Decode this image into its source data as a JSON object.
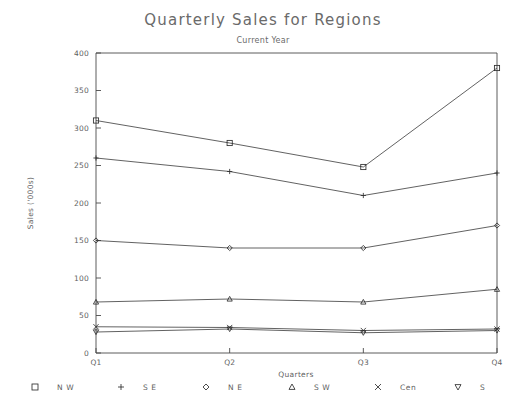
{
  "chart_data": {
    "type": "line",
    "title": "Quarterly Sales for Regions",
    "subtitle": "Current Year",
    "xlabel": "Quarters",
    "ylabel": "Sales ('000s)",
    "categories": [
      "Q1",
      "Q2",
      "Q3",
      "Q4"
    ],
    "ylim": [
      0,
      400
    ],
    "yticks": [
      "0",
      "50",
      "100",
      "150",
      "200",
      "250",
      "300",
      "350",
      "400"
    ],
    "ytick_values": [
      0,
      50,
      100,
      150,
      200,
      250,
      300,
      350,
      400
    ],
    "grid": false,
    "legend_position": "bottom",
    "series": [
      {
        "name": "N W",
        "marker": "square",
        "values": [
          310,
          280,
          248,
          380
        ]
      },
      {
        "name": "S E",
        "marker": "plus",
        "values": [
          260,
          242,
          210,
          240
        ]
      },
      {
        "name": "N E",
        "marker": "diamond",
        "values": [
          150,
          140,
          140,
          170
        ]
      },
      {
        "name": "S W",
        "marker": "triangle-up",
        "values": [
          68,
          72,
          68,
          85
        ]
      },
      {
        "name": "Cen",
        "marker": "cross",
        "values": [
          35,
          34,
          30,
          32
        ]
      },
      {
        "name": "S",
        "marker": "triangle-down",
        "values": [
          28,
          32,
          27,
          30
        ]
      }
    ]
  },
  "legend": {
    "items": [
      {
        "symbol": "□",
        "label": "N W"
      },
      {
        "symbol": "+",
        "label": "S E"
      },
      {
        "symbol": "◇",
        "label": "N E"
      },
      {
        "symbol": "△",
        "label": "S W"
      },
      {
        "symbol": "×",
        "label": "Cen"
      },
      {
        "symbol": "▽",
        "label": "S"
      }
    ]
  },
  "colors": {
    "background": "#ffffff",
    "axis": "#4a4a4a",
    "line": "#3a3a3a",
    "text": "#5f5f5f",
    "title": "#6a6a6a"
  }
}
